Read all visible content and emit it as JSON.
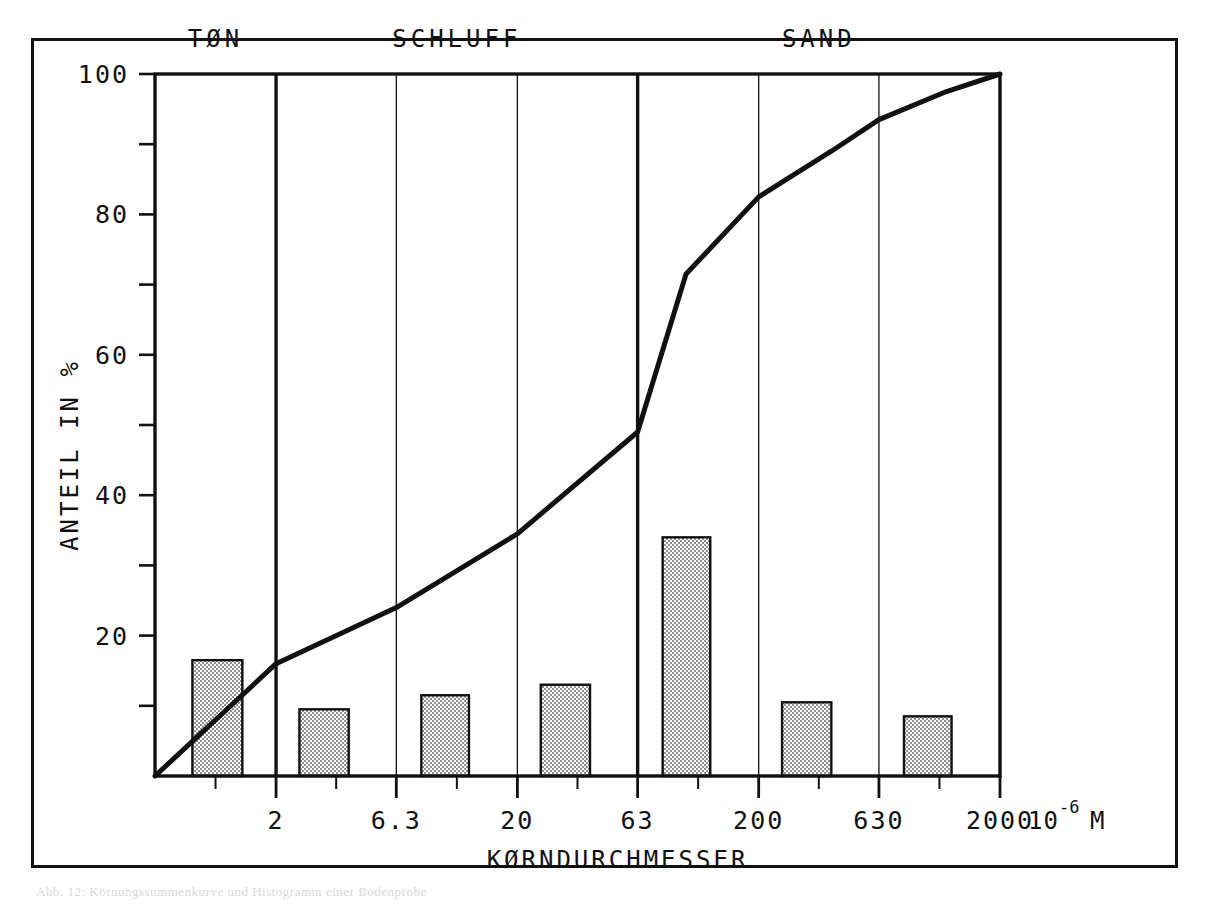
{
  "figure": {
    "caption": "Abb. 12: Körnungssummenkurve und Histogramm einer Bodenprobe"
  },
  "chart_data": {
    "type": "bar",
    "title": "",
    "subtitle": "",
    "xlabel": "KØRNDURCHMESSER",
    "xunit_base": "10",
    "xunit_exp": "-6",
    "xunit_suffix": "M",
    "ylabel": "ANTEIL IN %",
    "ylim": [
      0,
      100
    ],
    "xscale": "log",
    "xlim": [
      0.63,
      2000
    ],
    "grid": true,
    "legend": null,
    "x_ticks": [
      {
        "label": "2",
        "value": 2
      },
      {
        "label": "6.3",
        "value": 6.3
      },
      {
        "label": "20",
        "value": 20
      },
      {
        "label": "63",
        "value": 63
      },
      {
        "label": "200",
        "value": 200
      },
      {
        "label": "630",
        "value": 630
      },
      {
        "label": "2000",
        "value": 2000
      }
    ],
    "y_ticks_major": [
      20,
      40,
      60,
      80,
      100
    ],
    "y_ticks_minor": [
      10,
      30,
      50,
      70,
      90
    ],
    "bands": [
      {
        "label": "TØN",
        "from": 0.63,
        "to": 2
      },
      {
        "label": "SCHLUFF",
        "from": 2,
        "to": 63
      },
      {
        "label": "SAND",
        "from": 63,
        "to": 2000
      }
    ],
    "band_dividers": [
      2,
      63
    ],
    "histogram": {
      "name": "ANTEIL IN %",
      "bins": [
        {
          "from": 0.9,
          "to": 1.45,
          "value": 16.5
        },
        {
          "from": 2.5,
          "to": 4.0,
          "value": 9.5
        },
        {
          "from": 8.0,
          "to": 12.6,
          "value": 11.5
        },
        {
          "from": 25.0,
          "to": 40.0,
          "value": 13.0
        },
        {
          "from": 80.0,
          "to": 126.0,
          "value": 34.0
        },
        {
          "from": 250,
          "to": 400,
          "value": 10.5
        },
        {
          "from": 800,
          "to": 1260,
          "value": 8.5
        }
      ]
    },
    "cumulative_curve": {
      "name": "Körnungssummenkurve",
      "points": [
        {
          "x": 0.63,
          "y": 0
        },
        {
          "x": 2,
          "y": 16.0
        },
        {
          "x": 6.3,
          "y": 24.0
        },
        {
          "x": 20,
          "y": 34.5
        },
        {
          "x": 63,
          "y": 49.0
        },
        {
          "x": 100,
          "y": 71.5
        },
        {
          "x": 200,
          "y": 82.5
        },
        {
          "x": 400,
          "y": 89.0
        },
        {
          "x": 630,
          "y": 93.5
        },
        {
          "x": 1200,
          "y": 97.5
        },
        {
          "x": 2000,
          "y": 100
        }
      ]
    },
    "colors": {
      "line": "#111111",
      "bar_fill": "#8f8f8f",
      "bar_edge": "#111111",
      "axis": "#111111",
      "grid": "#111111",
      "background": "#ffffff"
    }
  }
}
